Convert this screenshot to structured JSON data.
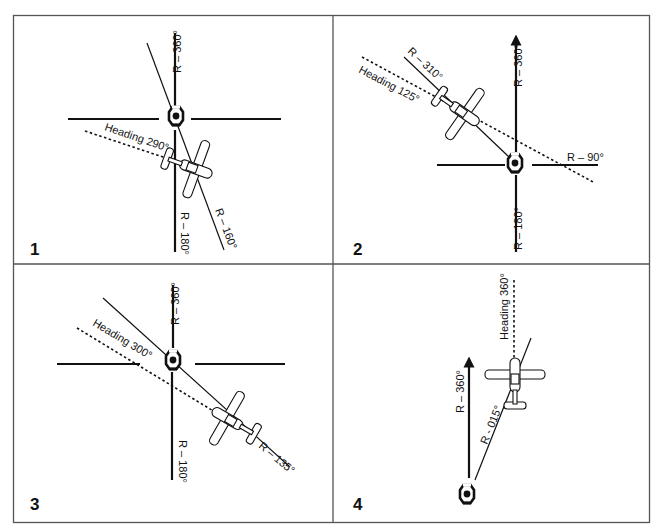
{
  "figure": {
    "panels": [
      {
        "number": "1",
        "labels": {
          "radial_north": "R – 360°",
          "radial_south": "R – 180°",
          "radial_aircraft": "R – 160°",
          "heading": "Heading 290°"
        }
      },
      {
        "number": "2",
        "labels": {
          "radial_north": "R – 360°",
          "radial_south": "R – 180°",
          "radial_east": "R – 90°",
          "radial_aircraft": "R – 310°",
          "heading": "Heading 125°"
        }
      },
      {
        "number": "3",
        "labels": {
          "radial_north": "R – 360°",
          "radial_south": "R – 180°",
          "radial_aircraft": "R – 135°",
          "heading": "Heading 300°"
        }
      },
      {
        "number": "4",
        "labels": {
          "radial_north": "R – 360°",
          "radial_aircraft": "R - 015°",
          "heading": "Heading 360°"
        }
      }
    ],
    "colors": {
      "ink": "#111111",
      "border": "#555555",
      "background": "#ffffff"
    }
  }
}
